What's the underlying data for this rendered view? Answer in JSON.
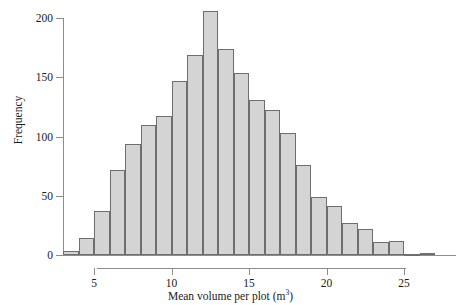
{
  "chart_data": {
    "type": "bar",
    "title": "",
    "subtitle": "",
    "xlabel": "Mean volume per plot (m3)",
    "xlabel_prefix": "Mean volume per plot (m",
    "xlabel_exponent": "3",
    "xlabel_suffix": ")",
    "ylabel": "Frequency",
    "xlim": [
      3,
      27
    ],
    "ylim": [
      0,
      210
    ],
    "grid": false,
    "legend": false,
    "bin_width": 1,
    "bar_fill_color": "#d4d4d4",
    "bar_edge_color": "#6e6e6e",
    "axis_color": "#8d8d8d",
    "x_ticks": [
      {
        "label": "5",
        "value": 5
      },
      {
        "label": "10",
        "value": 10
      },
      {
        "label": "15",
        "value": 15
      },
      {
        "label": "20",
        "value": 20
      },
      {
        "label": "25",
        "value": 25
      }
    ],
    "y_ticks": [
      {
        "label": "0",
        "value": 0
      },
      {
        "label": "50",
        "value": 50
      },
      {
        "label": "100",
        "value": 100
      },
      {
        "label": "150",
        "value": 150
      },
      {
        "label": "200",
        "value": 200
      }
    ],
    "categories": [
      "3-4",
      "4-5",
      "5-6",
      "6-7",
      "7-8",
      "8-9",
      "9-10",
      "10-11",
      "11-12",
      "12-13",
      "13-14",
      "14-15",
      "15-16",
      "16-17",
      "17-18",
      "18-19",
      "19-20",
      "20-21",
      "21-22",
      "22-23",
      "23-24",
      "24-25",
      "25-26",
      "26-27"
    ],
    "bins": [
      {
        "x0": 3,
        "x1": 4,
        "value": 3
      },
      {
        "x0": 4,
        "x1": 5,
        "value": 14
      },
      {
        "x0": 5,
        "x1": 6,
        "value": 37
      },
      {
        "x0": 6,
        "x1": 7,
        "value": 72
      },
      {
        "x0": 7,
        "x1": 8,
        "value": 94
      },
      {
        "x0": 8,
        "x1": 9,
        "value": 110
      },
      {
        "x0": 9,
        "x1": 10,
        "value": 117
      },
      {
        "x0": 10,
        "x1": 11,
        "value": 147
      },
      {
        "x0": 11,
        "x1": 12,
        "value": 169
      },
      {
        "x0": 12,
        "x1": 13,
        "value": 206
      },
      {
        "x0": 13,
        "x1": 14,
        "value": 174
      },
      {
        "x0": 14,
        "x1": 15,
        "value": 154
      },
      {
        "x0": 15,
        "x1": 16,
        "value": 131
      },
      {
        "x0": 16,
        "x1": 17,
        "value": 122
      },
      {
        "x0": 17,
        "x1": 18,
        "value": 103
      },
      {
        "x0": 18,
        "x1": 19,
        "value": 76
      },
      {
        "x0": 19,
        "x1": 20,
        "value": 49
      },
      {
        "x0": 20,
        "x1": 21,
        "value": 41
      },
      {
        "x0": 21,
        "x1": 22,
        "value": 27
      },
      {
        "x0": 22,
        "x1": 23,
        "value": 22
      },
      {
        "x0": 23,
        "x1": 24,
        "value": 11
      },
      {
        "x0": 24,
        "x1": 25,
        "value": 12
      },
      {
        "x0": 25,
        "x1": 26,
        "value": 1
      },
      {
        "x0": 26,
        "x1": 27,
        "value": 2
      }
    ],
    "values": [
      3,
      14,
      37,
      72,
      94,
      110,
      117,
      147,
      169,
      206,
      174,
      154,
      131,
      122,
      103,
      76,
      49,
      41,
      27,
      22,
      11,
      12,
      1,
      2
    ]
  },
  "plot_geometry": {
    "x_origin_px": 63,
    "x_unit_px": 15.5,
    "x_value_at_origin": 3.0,
    "y_baseline_px": 255,
    "y_unit_px": 1.185
  }
}
